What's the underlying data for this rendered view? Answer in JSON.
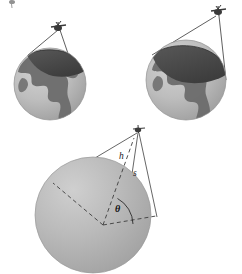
{
  "figure": {
    "type": "geometry-diagram",
    "background_color": "#ffffff",
    "width": 242,
    "height": 274
  },
  "colors": {
    "ocean": "#b9b9b9",
    "ocean_light": "#c9c9c9",
    "land": "#6e6e6e",
    "land_dark": "#5d5d5d",
    "coverage_cap": "#4a4a4a",
    "coverage_cap_edge": "#3a3a3a",
    "sphere": "#b5b5b5",
    "sphere_highlight": "#cfcfcf",
    "sphere_shadow": "#a0a0a0",
    "line": "#4d4d4d",
    "dashed_line": "#3c3c3c",
    "satellite_body": "#3a3a3a",
    "label_text": "#1a1a1a"
  },
  "panels": [
    {
      "id": "panel-top-left",
      "name": "low-altitude-satellite-coverage",
      "globe": {
        "cx": 50,
        "cy": 84,
        "r": 36
      },
      "satellite": {
        "x": 58,
        "y": 27
      },
      "beam_edges": [
        {
          "x": 28,
          "y": 56
        },
        {
          "x": 76,
          "y": 79
        }
      ],
      "coverage_width": "narrow"
    },
    {
      "id": "panel-top-right",
      "name": "high-altitude-satellite-coverage",
      "globe": {
        "cx": 186,
        "cy": 80,
        "r": 40
      },
      "satellite": {
        "x": 218,
        "y": 12
      },
      "beam_edges": [
        {
          "x": 153,
          "y": 55
        },
        {
          "x": 224,
          "y": 79
        }
      ],
      "coverage_width": "wide"
    },
    {
      "id": "panel-bottom",
      "name": "coverage-geometry-schematic",
      "sphere": {
        "cx": 93,
        "cy": 215,
        "r": 58
      },
      "satellite": {
        "x": 138,
        "y": 130
      },
      "center_point": {
        "x": 103,
        "y": 225
      },
      "horizon_left": {
        "x": 53,
        "y": 183
      },
      "horizon_right": {
        "x": 156,
        "y": 216
      },
      "angle_arc_label": "θ"
    }
  ],
  "labels": {
    "altitude": "h",
    "slant_range": "s",
    "earth_central_angle": "θ"
  },
  "label_positions": {
    "altitude": {
      "x": 119,
      "y": 159
    },
    "slant_range": {
      "x": 133,
      "y": 175
    },
    "earth_central_angle": {
      "x": 118,
      "y": 211
    }
  },
  "icons": {
    "satellite": "satellite-icon",
    "globe": "globe-icon",
    "sphere": "sphere-icon",
    "angle_arc": "angle-arc-icon"
  }
}
